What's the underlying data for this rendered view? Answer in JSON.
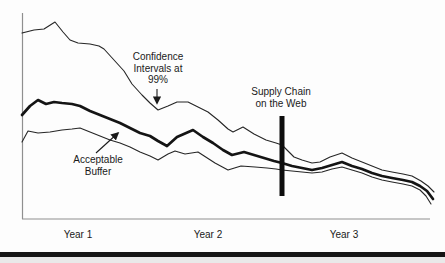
{
  "chart_data": {
    "type": "line",
    "title": "",
    "xlabel": "",
    "ylabel": "",
    "coordinate_system": "figure pixels, y increases downward (trend lines decline over time)",
    "grid": false,
    "legend": "none (labels drawn as in-plot annotations with arrows)",
    "x_axis": {
      "tick_labels": [
        "Year 1",
        "Year 2",
        "Year 3"
      ]
    },
    "series": [
      {
        "name": "upper-confidence-line",
        "style": "thin",
        "points": [
          [
            22,
            33
          ],
          [
            34,
            30
          ],
          [
            44,
            29
          ],
          [
            55,
            22
          ],
          [
            63,
            32
          ],
          [
            70,
            40
          ],
          [
            78,
            43
          ],
          [
            90,
            44
          ],
          [
            99,
            46
          ],
          [
            104,
            49
          ],
          [
            114,
            60
          ],
          [
            124,
            71
          ],
          [
            132,
            84
          ],
          [
            142,
            95
          ],
          [
            150,
            103
          ],
          [
            158,
            110
          ],
          [
            168,
            106
          ],
          [
            177,
            102
          ],
          [
            188,
            102
          ],
          [
            198,
            107
          ],
          [
            208,
            112
          ],
          [
            218,
            120
          ],
          [
            228,
            129
          ],
          [
            233,
            132
          ],
          [
            243,
            127
          ],
          [
            254,
            134
          ],
          [
            266,
            140
          ],
          [
            276,
            143
          ],
          [
            282,
            145
          ],
          [
            288,
            151
          ],
          [
            294,
            157
          ],
          [
            302,
            160
          ],
          [
            312,
            163
          ],
          [
            320,
            162
          ],
          [
            330,
            157
          ],
          [
            342,
            153
          ],
          [
            352,
            158
          ],
          [
            362,
            162
          ],
          [
            372,
            166
          ],
          [
            382,
            170
          ],
          [
            392,
            172
          ],
          [
            403,
            174
          ],
          [
            412,
            176
          ],
          [
            421,
            181
          ],
          [
            428,
            186
          ],
          [
            434,
            192
          ]
        ]
      },
      {
        "name": "forecast-line",
        "style": "thick",
        "points": [
          [
            22,
            115
          ],
          [
            30,
            106
          ],
          [
            38,
            100
          ],
          [
            46,
            104
          ],
          [
            54,
            102
          ],
          [
            62,
            103
          ],
          [
            72,
            104
          ],
          [
            80,
            106
          ],
          [
            90,
            111
          ],
          [
            100,
            115
          ],
          [
            110,
            119
          ],
          [
            120,
            123
          ],
          [
            130,
            128
          ],
          [
            140,
            133
          ],
          [
            150,
            136
          ],
          [
            158,
            141
          ],
          [
            167,
            146
          ],
          [
            177,
            137
          ],
          [
            193,
            130
          ],
          [
            203,
            137
          ],
          [
            213,
            143
          ],
          [
            223,
            150
          ],
          [
            232,
            155
          ],
          [
            244,
            152
          ],
          [
            254,
            155
          ],
          [
            264,
            158
          ],
          [
            274,
            161
          ],
          [
            282,
            163
          ],
          [
            292,
            166
          ],
          [
            302,
            168
          ],
          [
            312,
            170
          ],
          [
            322,
            168
          ],
          [
            332,
            165
          ],
          [
            342,
            162
          ],
          [
            352,
            166
          ],
          [
            362,
            169
          ],
          [
            372,
            173
          ],
          [
            382,
            176
          ],
          [
            392,
            178
          ],
          [
            403,
            180
          ],
          [
            412,
            182
          ],
          [
            420,
            186
          ],
          [
            427,
            191
          ],
          [
            433,
            199
          ]
        ]
      },
      {
        "name": "lower-confidence-line",
        "style": "thin",
        "points": [
          [
            22,
            142
          ],
          [
            28,
            131
          ],
          [
            38,
            133
          ],
          [
            50,
            132
          ],
          [
            62,
            130
          ],
          [
            72,
            129
          ],
          [
            80,
            128
          ],
          [
            90,
            132
          ],
          [
            100,
            136
          ],
          [
            110,
            140
          ],
          [
            120,
            143
          ],
          [
            130,
            147
          ],
          [
            140,
            152
          ],
          [
            150,
            156
          ],
          [
            158,
            160
          ],
          [
            168,
            154
          ],
          [
            175,
            151
          ],
          [
            185,
            154
          ],
          [
            198,
            152
          ],
          [
            215,
            163
          ],
          [
            228,
            170
          ],
          [
            241,
            166
          ],
          [
            255,
            167
          ],
          [
            267,
            168
          ],
          [
            276,
            169
          ],
          [
            282,
            170
          ],
          [
            292,
            171
          ],
          [
            302,
            172
          ],
          [
            312,
            173
          ],
          [
            322,
            172
          ],
          [
            332,
            169
          ],
          [
            342,
            167
          ],
          [
            352,
            170
          ],
          [
            362,
            173
          ],
          [
            372,
            177
          ],
          [
            382,
            180
          ],
          [
            392,
            182
          ],
          [
            403,
            184
          ],
          [
            412,
            186
          ],
          [
            420,
            190
          ],
          [
            426,
            196
          ],
          [
            431,
            204
          ]
        ]
      }
    ],
    "event_marker": {
      "x": 282,
      "y_top": 116,
      "y_bottom": 196
    },
    "annotations": [
      {
        "id": "confidence",
        "text": "Confidence\nIntervals at\n99%",
        "arrow": {
          "from": [
            157,
            89
          ],
          "to": [
            157,
            103
          ]
        }
      },
      {
        "id": "supply-chain",
        "text": "Supply Chain\non the Web",
        "arrow": null
      },
      {
        "id": "buffer",
        "text": "Acceptable\nBuffer",
        "arrow": {
          "from": [
            96,
            153
          ],
          "to": [
            118,
            133
          ]
        }
      }
    ],
    "colors": {
      "line": "#262626",
      "thick_line": "#141414",
      "axis": "#8f8f8f",
      "event_bar": "#0d0d0d",
      "page_rule": "#151515"
    }
  }
}
